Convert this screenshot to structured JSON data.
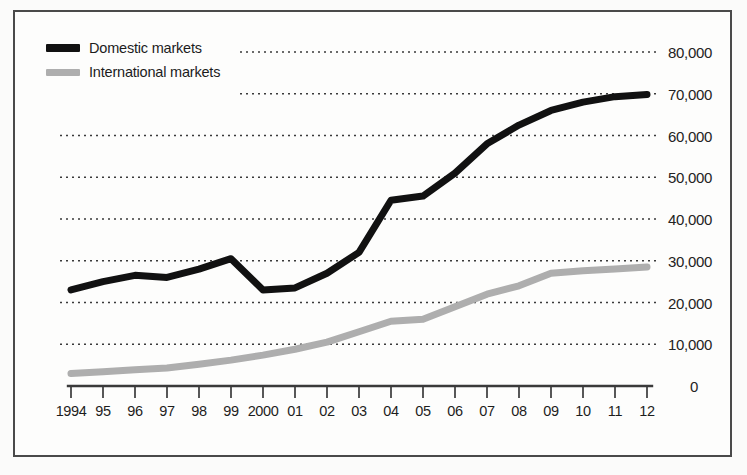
{
  "chart_data": {
    "type": "line",
    "title": "",
    "subtitle": "",
    "xlabel": "",
    "ylabel": "",
    "ylim": [
      0,
      80000
    ],
    "grid": true,
    "grid_style": "dotted-horizontal",
    "legend_position": "top-left",
    "x": [
      1994,
      1995,
      1996,
      1997,
      1998,
      1999,
      2000,
      2001,
      2002,
      2003,
      2004,
      2005,
      2006,
      2007,
      2008,
      2009,
      2010,
      2011,
      2012
    ],
    "x_tick_labels": [
      "1994",
      "95",
      "96",
      "97",
      "98",
      "99",
      "2000",
      "01",
      "02",
      "03",
      "04",
      "05",
      "06",
      "07",
      "08",
      "09",
      "10",
      "11",
      "12"
    ],
    "y_tick_labels": [
      "80,000",
      "70,000",
      "60,000",
      "50,000",
      "40,000",
      "30,000",
      "20,000",
      "10,000",
      "0"
    ],
    "y_tick_values": [
      80000,
      70000,
      60000,
      50000,
      40000,
      30000,
      20000,
      10000,
      0
    ],
    "series": [
      {
        "name": "Domestic markets",
        "color": "#111111",
        "values": [
          23000,
          25000,
          26500,
          26000,
          28000,
          30500,
          23000,
          23500,
          27000,
          32000,
          44500,
          45500,
          51000,
          58000,
          62500,
          66000,
          68000,
          69300,
          69800
        ]
      },
      {
        "name": "International markets",
        "color": "#aeaeae",
        "values": [
          3000,
          3400,
          3900,
          4300,
          5200,
          6200,
          7400,
          8800,
          10500,
          13000,
          15500,
          16000,
          19000,
          22000,
          24000,
          27000,
          27600,
          28000,
          28500
        ]
      }
    ]
  },
  "legend": {
    "items": [
      {
        "label": "Domestic markets",
        "color": "#111111"
      },
      {
        "label": "International markets",
        "color": "#aeaeae"
      }
    ]
  },
  "axes": {
    "y_labels": [
      "80,000",
      "70,000",
      "60,000",
      "50,000",
      "40,000",
      "30,000",
      "20,000",
      "10,000",
      "0"
    ],
    "x_labels": [
      "1994",
      "95",
      "96",
      "97",
      "98",
      "99",
      "2000",
      "01",
      "02",
      "03",
      "04",
      "05",
      "06",
      "07",
      "08",
      "09",
      "10",
      "11",
      "12"
    ]
  },
  "colors": {
    "domestic": "#111111",
    "international": "#aeaeae",
    "grid": "#3a3a3a",
    "axis": "#3a3a3a",
    "frame": "#4a4a4a",
    "background": "#fdfdfc"
  }
}
